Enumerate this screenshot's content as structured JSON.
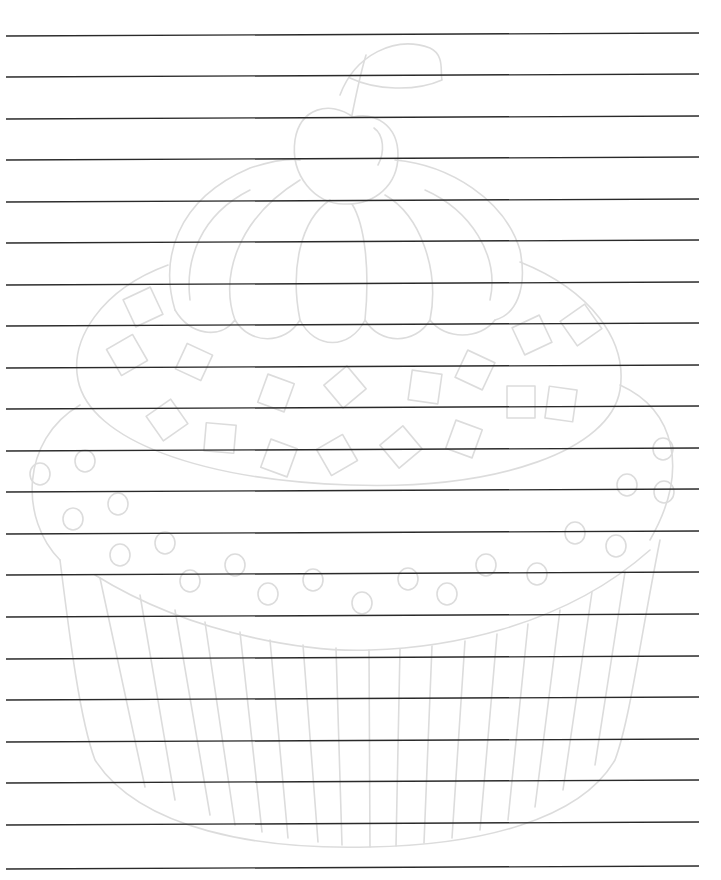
{
  "page": {
    "type": "lined-writing-paper",
    "background": "#ffffff",
    "line_color": "#2a2a2a",
    "watermark_color": "#dcdcdc",
    "line_x_start": 6,
    "line_x_end": 699,
    "line_slope_px": -3,
    "line_count": 21,
    "lines_y": [
      36,
      77,
      119,
      160,
      202,
      243,
      285,
      326,
      368,
      409,
      451,
      492,
      534,
      575,
      617,
      659,
      700,
      742,
      783,
      825,
      869
    ]
  },
  "watermark": {
    "subject": "cupcake",
    "parts": [
      "cherry",
      "stem",
      "leaf",
      "frosting-swirl",
      "sprinkles",
      "cake-top-dots",
      "paper-liner"
    ]
  }
}
